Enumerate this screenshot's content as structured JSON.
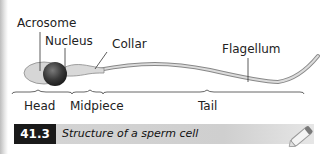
{
  "labels": {
    "acrosome": "Acrosome",
    "nucleus": "Nucleus",
    "collar": "Collar",
    "flagellum": "Flagellum",
    "head": "Head",
    "midpiece": "Midpiece",
    "tail": "Tail"
  },
  "caption": {
    "number": "41.3",
    "text": "Structure of a sperm cell"
  },
  "icons": {
    "corner": "pencil-icon"
  }
}
